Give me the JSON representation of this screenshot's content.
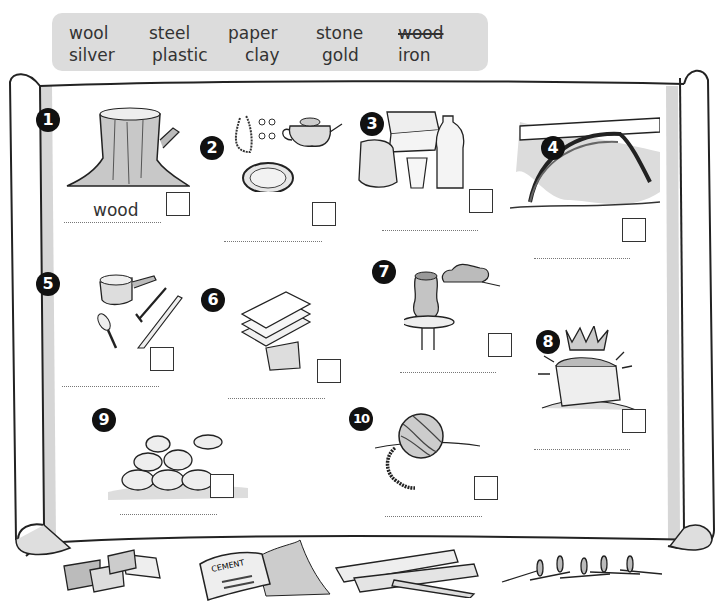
{
  "word_bank": {
    "rows": [
      [
        "wool",
        "steel",
        "paper",
        "stone",
        "wood"
      ],
      [
        "silver",
        "plastic",
        "clay",
        "gold",
        "iron"
      ]
    ],
    "struck_words": [
      "wood"
    ]
  },
  "items": [
    {
      "number": "1",
      "picture": "tree-stump",
      "answer": "wood"
    },
    {
      "number": "2",
      "picture": "silver-jewellery-teapot-plate",
      "answer": ""
    },
    {
      "number": "3",
      "picture": "plastic-tub-bag-cup-bottle",
      "answer": ""
    },
    {
      "number": "4",
      "picture": "iron-bridge",
      "answer": ""
    },
    {
      "number": "5",
      "picture": "saucepan-cutlery",
      "answer": ""
    },
    {
      "number": "6",
      "picture": "paper-sheets",
      "answer": ""
    },
    {
      "number": "7",
      "picture": "clay-pot-on-wheel",
      "answer": ""
    },
    {
      "number": "8",
      "picture": "crown-treasure-chest",
      "answer": ""
    },
    {
      "number": "9",
      "picture": "stone-wall",
      "answer": ""
    },
    {
      "number": "10",
      "picture": "ball-of-wool",
      "answer": ""
    }
  ],
  "bottom_pictures": [
    {
      "name": "bricks"
    },
    {
      "name": "cement-bag",
      "label": "CEMENT"
    },
    {
      "name": "wooden-planks"
    },
    {
      "name": "nails"
    }
  ],
  "colors": {
    "wordbank_bg": "#dcdcdc",
    "badge": "#111111",
    "scroll_shadow": "#d6d6d6"
  }
}
